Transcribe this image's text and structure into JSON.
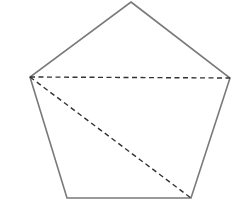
{
  "diagram": {
    "type": "geometry",
    "shape": "pentagon",
    "background": "#ffffff",
    "vertices": {
      "top": [
        131,
        2
      ],
      "left": [
        30,
        77
      ],
      "right": [
        230,
        78
      ],
      "bottom_left": [
        67,
        198
      ],
      "bottom_right": [
        191,
        198
      ]
    },
    "edge_color": "#7a7a7a",
    "diagonal_color": "#333333",
    "diagonals": [
      {
        "from": "left",
        "to": "right",
        "style": "dashed"
      },
      {
        "from": "left",
        "to": "bottom_right",
        "style": "dashed"
      }
    ]
  }
}
